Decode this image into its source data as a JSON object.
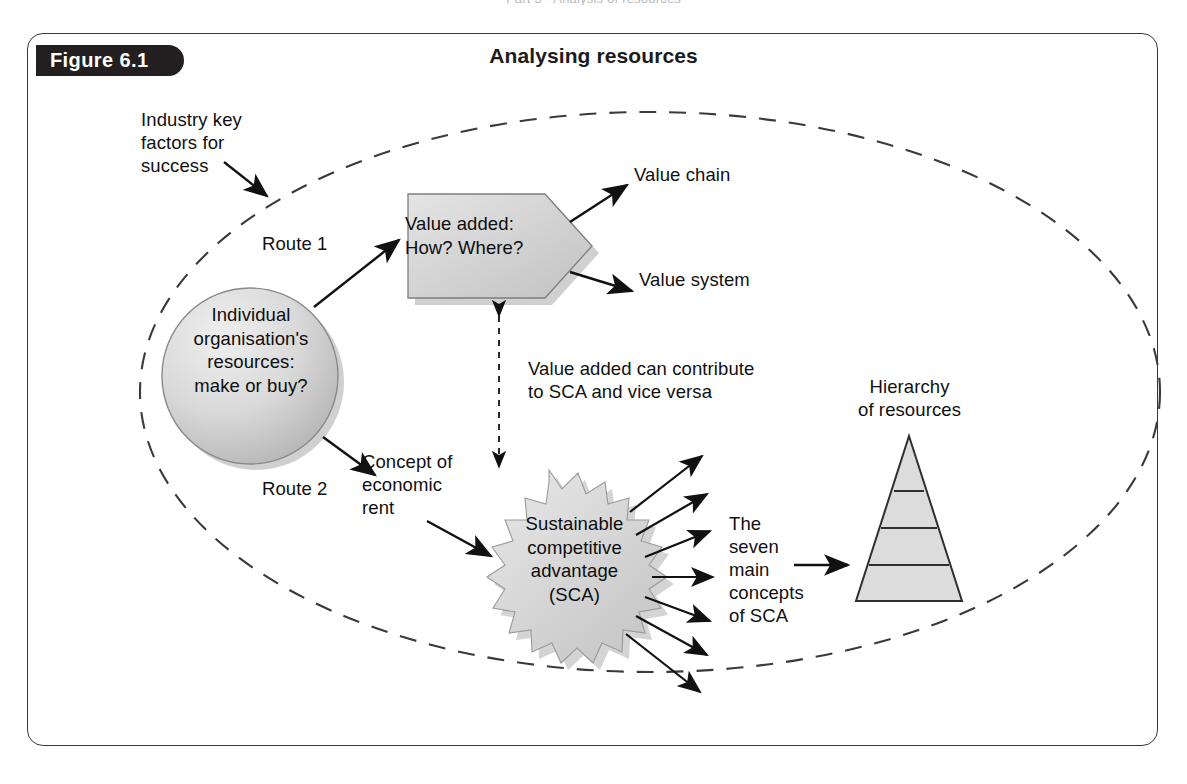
{
  "page": {
    "running_head": "Part 3 · Analysis of resources",
    "figure_label": "Figure 6.1",
    "figure_title": "Analysing resources",
    "background_color": "#ffffff",
    "frame_color": "#35373a",
    "badge_color": "#231f20",
    "shape_fill": "#d4d4d4",
    "shape_stroke": "#5a5a5a",
    "line_color": "#111111"
  },
  "diagram": {
    "boundary": {
      "name": "organisation-boundary",
      "style": "dashed-ellipse"
    },
    "labels": {
      "industry_key_factors": "Industry key\nfactors for\nsuccess",
      "route_1": "Route 1",
      "route_2": "Route 2",
      "concept_of_economic_rent": "Concept of\neconomic\nrent",
      "value_chain": "Value chain",
      "value_system": "Value system",
      "contribution_note": "Value added can contribute\nto SCA and vice versa",
      "seven_main_concepts": "The\nseven\nmain\nconcepts\nof SCA",
      "hierarchy_of_resources": "Hierarchy\nof resources"
    },
    "nodes": {
      "organisation_circle": "Individual\norganisation's\nresources:\nmake or buy?",
      "value_added_pentagon": "Value added:\nHow? Where?",
      "sca_starburst": "Sustainable\ncompetitive\nadvantage\n(SCA)"
    },
    "pyramid": {
      "name": "hierarchy-pyramid",
      "levels": 4
    },
    "arrow_counts": {
      "sca_outbound": 7
    }
  }
}
